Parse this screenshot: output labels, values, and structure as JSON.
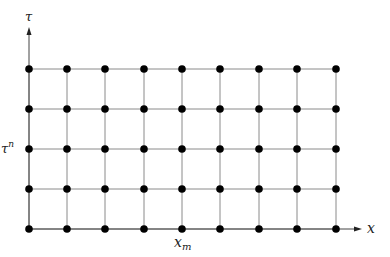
{
  "diagram": {
    "type": "computational-grid",
    "axes": {
      "vertical": {
        "label": "τ"
      },
      "horizontal": {
        "label": "x"
      }
    },
    "labels": {
      "row_label": "τ",
      "row_label_sup": "n",
      "col_label": "x",
      "col_label_sub": "m"
    },
    "grid": {
      "columns": 9,
      "rows": 5,
      "x_positions": [
        29,
        67,
        105,
        144,
        182,
        220,
        259,
        297,
        336
      ],
      "y_positions": [
        69,
        109,
        149,
        189,
        229
      ],
      "labeled_row_index": 2,
      "labeled_column_index": 4
    },
    "colors": {
      "grid_line": "#8a8a8a",
      "node": "#000000",
      "axis": "#444444"
    }
  }
}
